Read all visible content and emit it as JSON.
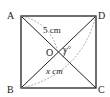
{
  "diagram": {
    "type": "geometry-square-with-diagonals",
    "vertices": {
      "A": {
        "label": "A"
      },
      "B": {
        "label": "B"
      },
      "C": {
        "label": "C"
      },
      "D": {
        "label": "D"
      },
      "O": {
        "label": "O"
      }
    },
    "measurements": {
      "AO_label": "5 cm",
      "BD_label": "x cm",
      "angle_label": "y°"
    },
    "colors": {
      "line": "#222222",
      "dashed": "#888888",
      "background": "#ffffff"
    }
  }
}
